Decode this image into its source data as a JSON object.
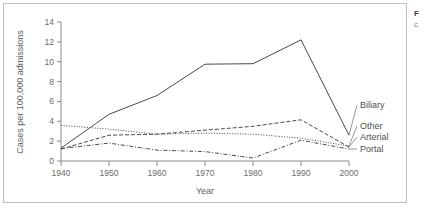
{
  "figure": {
    "caption_lead": "F",
    "caption_rest": "c"
  },
  "chart_data": {
    "type": "line",
    "title": "",
    "xlabel": "Year",
    "ylabel": "Cases per 100,000 admissions",
    "x": [
      1940,
      1950,
      1960,
      1970,
      1980,
      1990,
      2000
    ],
    "xlim": [
      1940,
      2000
    ],
    "ylim": [
      0,
      14
    ],
    "x_ticks": [
      "1940",
      "1950",
      "1960",
      "1970",
      "1980",
      "1990",
      "2000"
    ],
    "y_ticks": [
      "0",
      "2",
      "4",
      "6",
      "8",
      "10",
      "12",
      "14"
    ],
    "y_tick_values": [
      0,
      2,
      4,
      6,
      8,
      10,
      12,
      14
    ],
    "grid": false,
    "legend_position": "right-end-labels",
    "series": [
      {
        "name": "Biliary",
        "style": "solid",
        "values": [
          1.3,
          4.7,
          6.6,
          9.75,
          9.8,
          12.2,
          2.6
        ]
      },
      {
        "name": "Other",
        "style": "dotted",
        "values": [
          3.6,
          3.2,
          2.7,
          2.8,
          2.7,
          2.3,
          1.5
        ]
      },
      {
        "name": "Arterial",
        "style": "dashed",
        "values": [
          1.2,
          2.6,
          2.7,
          3.1,
          3.5,
          4.15,
          1.4
        ]
      },
      {
        "name": "Portal",
        "style": "dash-dot",
        "values": [
          1.25,
          1.8,
          1.1,
          0.95,
          0.3,
          2.1,
          1.2
        ]
      }
    ]
  }
}
